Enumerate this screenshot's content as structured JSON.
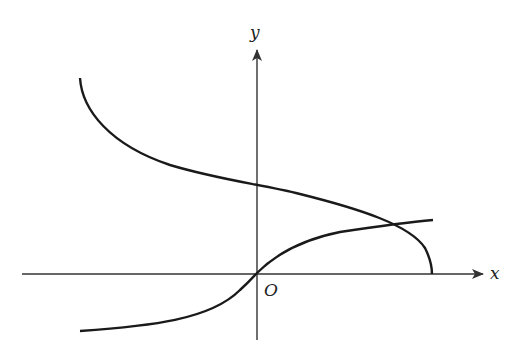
{
  "diagram": {
    "axes": {
      "x_label": "x",
      "y_label": "y",
      "origin_label": "O"
    },
    "curves": [
      {
        "name": "curve-increasing",
        "description": "increasing curve through the origin, concave down for x>0"
      },
      {
        "name": "curve-decreasing",
        "description": "decreasing curve meeting the x-axis with a vertical tangent"
      }
    ],
    "stroke_color": "#1a1a1a",
    "axis_color": "#333333"
  }
}
